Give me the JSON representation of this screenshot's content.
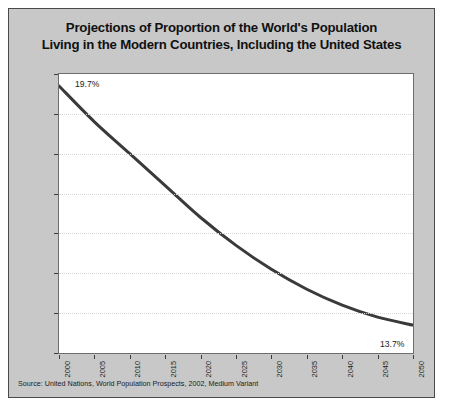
{
  "title": {
    "line1": "Projections of Proportion of the World's Population",
    "line2": "Living in the Modern Countries, Including the United States"
  },
  "source": "Source: United Nations, World Population Prospects, 2002, Medium Variant",
  "labels": {
    "start": "19.7%",
    "end": "13.7%"
  },
  "colors": {
    "panel_background": "#c8c8c8",
    "plot_background": "#ffffff",
    "line": "#3a3a3a",
    "grid": "#d8d8d8",
    "axis": "#6d6d6d",
    "text": "#1b1b1b"
  },
  "chart_data": {
    "type": "line",
    "title": "Projections of Proportion of the World's Population Living in the Modern Countries, Including the United States",
    "xlabel": "",
    "ylabel": "",
    "x": [
      2000,
      2005,
      2010,
      2015,
      2020,
      2025,
      2030,
      2035,
      2040,
      2045,
      2050
    ],
    "categories": [
      "2000",
      "2005",
      "2010",
      "2015",
      "2020",
      "2025",
      "2030",
      "2035",
      "2040",
      "2045",
      "2050"
    ],
    "values": [
      19.7,
      18.8,
      18.0,
      17.2,
      16.4,
      15.7,
      15.1,
      14.6,
      14.2,
      13.9,
      13.7
    ],
    "series": [
      {
        "name": "Proportion of world population",
        "values": [
          19.7,
          18.8,
          18.0,
          17.2,
          16.4,
          15.7,
          15.1,
          14.6,
          14.2,
          13.9,
          13.7
        ]
      }
    ],
    "point_labels": [
      {
        "x": 2000,
        "y": 19.7,
        "text": "19.7%"
      },
      {
        "x": 2050,
        "y": 13.7,
        "text": "13.7%"
      }
    ],
    "ylim": [
      13,
      20
    ],
    "xlim": [
      2000,
      2050
    ],
    "yticks": [
      13,
      14,
      15,
      16,
      17,
      18,
      19,
      20
    ],
    "ytick_labels": [
      "13%",
      "14%",
      "15%",
      "16%",
      "17%",
      "18%",
      "19%",
      "20%"
    ],
    "xticks": [
      2000,
      2005,
      2010,
      2015,
      2020,
      2025,
      2030,
      2035,
      2040,
      2045,
      2050
    ],
    "xtick_labels": [
      "2000",
      "2005",
      "2010",
      "2015",
      "2020",
      "2025",
      "2030",
      "2035",
      "2040",
      "2045",
      "2050"
    ],
    "grid": true,
    "grid_axis": "y",
    "legend": false,
    "units": "percent"
  }
}
